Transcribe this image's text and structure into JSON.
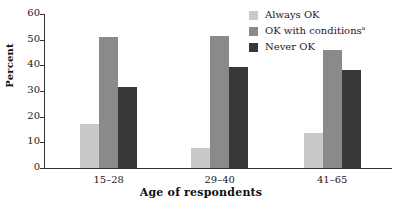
{
  "chart_data": {
    "type": "bar",
    "title": "",
    "subtitle": "",
    "xlabel": "Age of respondents",
    "ylabel": "Percent",
    "categories": [
      "15–28",
      "29–40",
      "41–65"
    ],
    "series": [
      {
        "name": "Always OK",
        "color": "#c9c9c9",
        "values": [
          17,
          7.8,
          13.5
        ]
      },
      {
        "name": "OK with conditions",
        "footnote_marker": "a",
        "color": "#8a8a8a",
        "values": [
          51,
          51.5,
          46
        ]
      },
      {
        "name": "Never OK",
        "color": "#383838",
        "values": [
          31.5,
          39.5,
          38
        ]
      }
    ],
    "ylim": [
      0,
      60
    ],
    "yticks": [
      0,
      10,
      20,
      30,
      40,
      50,
      60
    ],
    "ytick_labels": [
      "0",
      "10",
      "20",
      "30",
      "40",
      "50",
      "60"
    ],
    "grid": false,
    "legend_position": "top-right",
    "axis_color": "#333333",
    "background": "#ffffff"
  },
  "legend": {
    "items": [
      {
        "label": "Always OK",
        "marker": ""
      },
      {
        "label": "OK with conditions",
        "marker": "a"
      },
      {
        "label": "Never OK",
        "marker": ""
      }
    ]
  }
}
